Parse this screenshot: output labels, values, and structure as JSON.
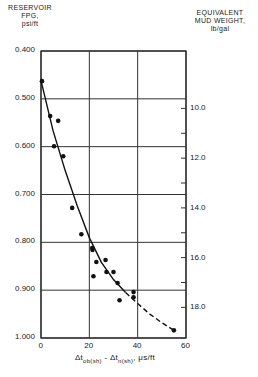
{
  "chart_data": {
    "type": "scatter",
    "title": "",
    "left_axis_title": [
      "RESERVOIR",
      "FPG,",
      "psi/ft"
    ],
    "right_axis_title": [
      "EQUIVALENT",
      "MUD WEIGHT,",
      "lb/gal"
    ],
    "xlabel": "Δt ob(sh) - Δt n(sh), μs/ft",
    "ylabel": "RESERVOIR FPG, psi/ft",
    "y2label": "EQUIVALENT MUD WEIGHT, lb/gal",
    "xlim": [
      0,
      60
    ],
    "ylim": [
      0.4,
      1.0
    ],
    "y_inverted": true,
    "x_ticks": [
      "0",
      "20",
      "40",
      "60"
    ],
    "y_ticks": [
      "0.400",
      "0.500",
      "0.600",
      "0.700",
      "0.800",
      "0.900",
      "1.000"
    ],
    "y2_ticks": [
      "10.0",
      "12.0",
      "14.0",
      "16.0",
      "18.0"
    ],
    "grid": true,
    "series": [
      {
        "name": "observed data",
        "points": [
          [
            0.4,
            0.463
          ],
          [
            3.8,
            0.536
          ],
          [
            7.1,
            0.546
          ],
          [
            5.4,
            0.599
          ],
          [
            9.2,
            0.62
          ],
          [
            12.9,
            0.728
          ],
          [
            16.7,
            0.783
          ],
          [
            21.2,
            0.812
          ],
          [
            21.3,
            0.816
          ],
          [
            22.9,
            0.841
          ],
          [
            26.7,
            0.837
          ],
          [
            21.7,
            0.871
          ],
          [
            27.1,
            0.862
          ],
          [
            30.0,
            0.862
          ],
          [
            31.7,
            0.885
          ],
          [
            38.3,
            0.904
          ],
          [
            38.3,
            0.915
          ],
          [
            32.5,
            0.921
          ],
          [
            55.0,
            0.984
          ]
        ]
      },
      {
        "name": "trend curve (solid)",
        "points": [
          [
            0,
            0.462
          ],
          [
            5,
            0.567
          ],
          [
            10,
            0.65
          ],
          [
            15,
            0.724
          ],
          [
            20,
            0.79
          ],
          [
            25,
            0.842
          ],
          [
            30,
            0.878
          ],
          [
            35,
            0.905
          ]
        ]
      },
      {
        "name": "trend curve (dashed extrapolation)",
        "points": [
          [
            35,
            0.905
          ],
          [
            40,
            0.928
          ],
          [
            45,
            0.95
          ],
          [
            50,
            0.968
          ],
          [
            55,
            0.984
          ]
        ]
      }
    ]
  }
}
